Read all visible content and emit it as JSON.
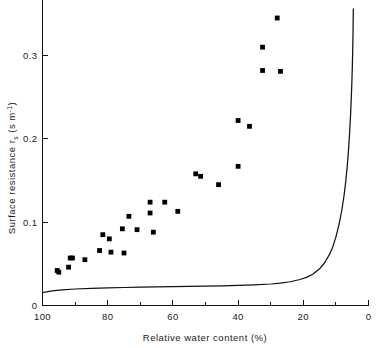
{
  "chart_data": {
    "type": "scatter",
    "title": "",
    "xlabel": "Relative water content (%)",
    "ylabel": "Surface resistance r_s (s m⁻¹)",
    "ylabel_main": "Surface resistance r",
    "ylabel_sub": "s",
    "ylabel_units_open": " (s m",
    "ylabel_units_exp": "-1",
    "ylabel_units_close": ")",
    "xlim": [
      100,
      0
    ],
    "ylim": [
      0,
      0.355
    ],
    "x_axis_reversed": true,
    "grid": false,
    "legend": "none",
    "x_ticks_major": [
      100,
      80,
      60,
      40,
      20,
      0
    ],
    "x_tick_labels": [
      "100",
      "80",
      "60",
      "40",
      "20",
      "0"
    ],
    "x_ticks_minor": [
      90,
      70,
      50,
      30,
      10
    ],
    "y_ticks_major": [
      0,
      0.1,
      0.2,
      0.3
    ],
    "y_tick_labels": [
      "0",
      "0.1",
      "0.2",
      "0.3"
    ],
    "series": [
      {
        "name": "Measured surface resistance",
        "type": "scatter",
        "marker": "square",
        "color": "#000000",
        "points": [
          [
            95.5,
            0.042
          ],
          [
            95.0,
            0.04
          ],
          [
            92.0,
            0.046
          ],
          [
            91.5,
            0.057
          ],
          [
            90.8,
            0.057
          ],
          [
            87.0,
            0.055
          ],
          [
            82.5,
            0.066
          ],
          [
            81.5,
            0.085
          ],
          [
            79.5,
            0.08
          ],
          [
            79.0,
            0.064
          ],
          [
            75.5,
            0.092
          ],
          [
            75.0,
            0.063
          ],
          [
            73.5,
            0.107
          ],
          [
            71.0,
            0.091
          ],
          [
            67.0,
            0.124
          ],
          [
            67.0,
            0.111
          ],
          [
            66.0,
            0.088
          ],
          [
            62.5,
            0.124
          ],
          [
            58.5,
            0.113
          ],
          [
            53.0,
            0.158
          ],
          [
            51.5,
            0.155
          ],
          [
            46.0,
            0.145
          ],
          [
            40.0,
            0.222
          ],
          [
            40.0,
            0.167
          ],
          [
            36.5,
            0.215
          ],
          [
            32.5,
            0.31
          ],
          [
            32.5,
            0.282
          ],
          [
            28.0,
            0.345
          ],
          [
            27.0,
            0.281
          ]
        ]
      },
      {
        "name": "Modelled surface resistance",
        "type": "line",
        "color": "#111111",
        "points": [
          [
            100.0,
            0.0155
          ],
          [
            97.0,
            0.0175
          ],
          [
            94.0,
            0.0188
          ],
          [
            90.0,
            0.0198
          ],
          [
            85.0,
            0.0206
          ],
          [
            80.0,
            0.0212
          ],
          [
            75.0,
            0.0216
          ],
          [
            70.0,
            0.022
          ],
          [
            65.0,
            0.0223
          ],
          [
            60.0,
            0.0226
          ],
          [
            55.0,
            0.0229
          ],
          [
            50.0,
            0.0232
          ],
          [
            45.0,
            0.0236
          ],
          [
            40.0,
            0.0241
          ],
          [
            35.0,
            0.0248
          ],
          [
            30.0,
            0.0258
          ],
          [
            27.0,
            0.0268
          ],
          [
            24.0,
            0.0285
          ],
          [
            21.0,
            0.0312
          ],
          [
            19.0,
            0.0338
          ],
          [
            17.0,
            0.0378
          ],
          [
            15.0,
            0.044
          ],
          [
            13.5,
            0.051
          ],
          [
            12.0,
            0.061
          ],
          [
            11.0,
            0.07
          ],
          [
            10.0,
            0.082
          ],
          [
            9.0,
            0.098
          ],
          [
            8.2,
            0.114
          ],
          [
            7.5,
            0.132
          ],
          [
            7.0,
            0.148
          ],
          [
            6.5,
            0.168
          ],
          [
            6.1,
            0.188
          ],
          [
            5.8,
            0.207
          ],
          [
            5.5,
            0.229
          ],
          [
            5.3,
            0.247
          ],
          [
            5.1,
            0.268
          ],
          [
            4.95,
            0.288
          ],
          [
            4.85,
            0.306
          ],
          [
            4.75,
            0.326
          ],
          [
            4.7,
            0.342
          ],
          [
            4.65,
            0.356
          ]
        ]
      }
    ]
  },
  "axes": {
    "x_title": "Relative water content (%)",
    "y_title_part1": "Surface resistance r",
    "y_title_sub": "s",
    "y_title_part2": "(s m",
    "y_title_exp": "-1",
    "y_title_part3": ")"
  },
  "tick_labels": {
    "x": [
      "100",
      "80",
      "60",
      "40",
      "20",
      "0"
    ],
    "y": [
      "0.3",
      "0.2",
      "0.1",
      "0"
    ]
  }
}
